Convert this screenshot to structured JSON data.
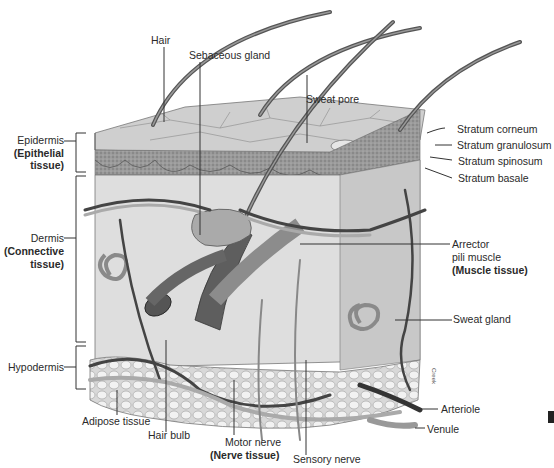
{
  "figure": {
    "labels_left": {
      "epidermis": "Epidermis",
      "epidermis_tissue_1": "(Epithelial",
      "epidermis_tissue_2": "tissue)",
      "dermis": "Dermis",
      "dermis_tissue_1": "(Connective",
      "dermis_tissue_2": "tissue)",
      "hypodermis": "Hypodermis"
    },
    "labels_top": {
      "hair": "Hair",
      "sebaceous_gland": "Sebaceous gland",
      "sweat_pore": "Sweat pore"
    },
    "labels_right": {
      "stratum_corneum": "Stratum corneum",
      "stratum_granulosum": "Stratum granulosum",
      "stratum_spinosum": "Stratum spinosum",
      "stratum_basale": "Stratum basale",
      "arrector_1": "Arrector",
      "arrector_2": "pili muscle",
      "arrector_tissue": "(Muscle tissue)",
      "sweat_gland": "Sweat gland",
      "arteriole": "Arteriole",
      "venule": "Venule"
    },
    "labels_bottom": {
      "adipose_tissue": "Adipose tissue",
      "hair_bulb": "Hair bulb",
      "motor_nerve": "Motor nerve",
      "nerve_tissue": "(Nerve tissue)",
      "sensory_nerve": "Sensory nerve"
    },
    "artist_signature": "Creek",
    "colors": {
      "surface": "#c9c9c9",
      "epidermis": "#8f8f8f",
      "dermis": "#dcdcdc",
      "fat": "#eeeeee",
      "vessel_dark": "#3a3a3a",
      "vessel_light": "#a8a8a8"
    }
  }
}
